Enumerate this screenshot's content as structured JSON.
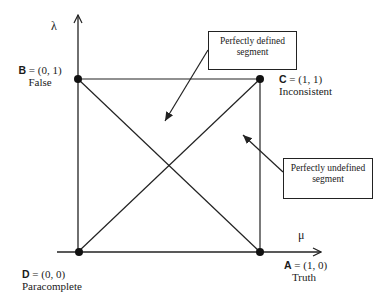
{
  "diagram": {
    "axes": {
      "x_label": "μ",
      "y_label": "λ"
    },
    "vertices": {
      "A": {
        "letter": "A",
        "coords": " = (1, 0)",
        "name": "Truth"
      },
      "B": {
        "letter": "B",
        "coords": " = (0, 1)",
        "name": "False"
      },
      "C": {
        "letter": "C",
        "coords": " = (1, 1)",
        "name": "Inconsistent"
      },
      "D": {
        "letter": "D",
        "coords": " = (0, 0)",
        "name": "Paracomplete"
      }
    },
    "callouts": {
      "defined": {
        "line1": "Perfectly defined",
        "line2": "segment"
      },
      "undefined": {
        "line1": "Perfectly undefined",
        "line2": "segment"
      }
    },
    "colors": {
      "line": "#222222",
      "background": "#ffffff"
    }
  }
}
